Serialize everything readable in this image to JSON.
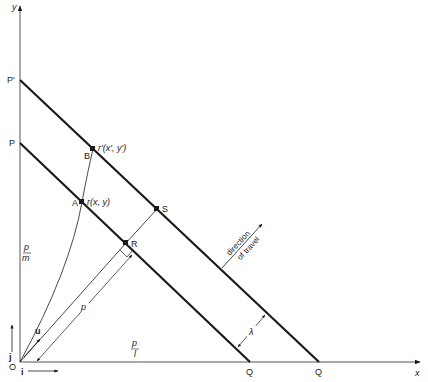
{
  "diagram": {
    "axes": {
      "x_label": "x",
      "y_label": "y",
      "origin_label": "O",
      "unit_i": "i",
      "unit_j": "j"
    },
    "points": {
      "P": "P",
      "P_prime": "P'",
      "Q": "Q",
      "Q_prime": "Q",
      "A": "A",
      "B": "B",
      "R": "R",
      "S": "S"
    },
    "vector_labels": {
      "r": "r(x, y)",
      "r_prime": "r'(x', y')",
      "u": "u",
      "p": "p"
    },
    "intercepts": {
      "y_num": "p",
      "y_den": "m",
      "x_num": "p",
      "x_den": "l"
    },
    "spacing_label": "λ",
    "direction": {
      "line1": "direction",
      "line2": "of travel"
    },
    "colors": {
      "ink": "#1a1a1a",
      "axis": "#555555",
      "background": "#ffffff"
    }
  }
}
